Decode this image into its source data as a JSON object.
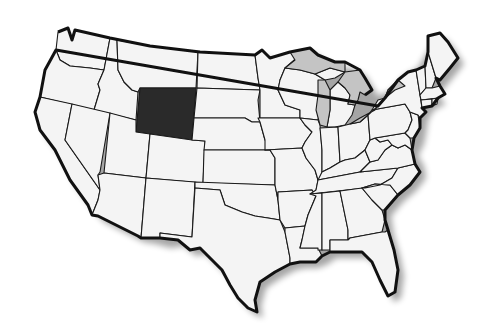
{
  "map": {
    "title": "United States map",
    "highlighted_state": "Wyoming",
    "colors": {
      "background": "#ffffff",
      "state_fill": "#f4f4f4",
      "highlight_fill": "#2a2a2a",
      "lake_fill": "#c4c4c4",
      "border": "#1a1a1a"
    },
    "states": [
      "Washington",
      "Oregon",
      "California",
      "Idaho",
      "Nevada",
      "Montana",
      "Wyoming",
      "Utah",
      "Arizona",
      "Colorado",
      "New Mexico",
      "North Dakota",
      "South Dakota",
      "Nebraska",
      "Kansas",
      "Oklahoma",
      "Texas",
      "Minnesota",
      "Iowa",
      "Missouri",
      "Arkansas",
      "Louisiana",
      "Wisconsin",
      "Illinois",
      "Michigan",
      "Indiana",
      "Ohio",
      "Kentucky",
      "Tennessee",
      "Mississippi",
      "Alabama",
      "Georgia",
      "Florida",
      "South Carolina",
      "North Carolina",
      "Virginia",
      "West Virginia",
      "Maryland",
      "Delaware",
      "Pennsylvania",
      "New Jersey",
      "New York",
      "Connecticut",
      "Rhode Island",
      "Massachusetts",
      "Vermont",
      "New Hampshire",
      "Maine"
    ],
    "lakes": [
      "Lake Superior",
      "Lake Michigan",
      "Lake Huron",
      "Lake Erie",
      "Lake Ontario"
    ]
  }
}
